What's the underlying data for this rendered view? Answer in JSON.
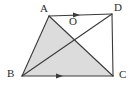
{
  "figure": {
    "kind": "geometry-diagram",
    "width": 135,
    "height": 91,
    "background_color": "#ffffff",
    "stroke_color": "#3a3a3a",
    "shaded_fill_color": "#dcdcdc",
    "label_color": "#2b2b2b",
    "labels": {
      "a": "A",
      "b": "B",
      "c": "C",
      "d": "D",
      "o": "O"
    },
    "points": {
      "A": {
        "x": 49,
        "y": 16
      },
      "B": {
        "x": 22,
        "y": 76
      },
      "C": {
        "x": 113,
        "y": 76
      },
      "D": {
        "x": 112,
        "y": 14
      },
      "O": {
        "x": 72,
        "y": 29
      }
    },
    "segments": [
      {
        "name": "AD",
        "from": "A",
        "to": "D",
        "arrow": "single-right"
      },
      {
        "name": "BC",
        "from": "B",
        "to": "C",
        "arrow": "single-right"
      },
      {
        "name": "AB",
        "from": "A",
        "to": "B",
        "arrow": "none"
      },
      {
        "name": "DC",
        "from": "D",
        "to": "C",
        "arrow": "none"
      },
      {
        "name": "AC",
        "from": "A",
        "to": "C",
        "arrow": "none"
      },
      {
        "name": "BD",
        "from": "B",
        "to": "D",
        "arrow": "none"
      }
    ],
    "shaded_region": {
      "name": "triangle-abc",
      "vertices": [
        "A",
        "B",
        "C"
      ]
    },
    "arrow_markers": [
      {
        "on": "AD",
        "at_x": 80,
        "at_y": 15,
        "direction": "right"
      },
      {
        "on": "BC",
        "at_x": 63,
        "at_y": 76,
        "direction": "right"
      }
    ]
  }
}
